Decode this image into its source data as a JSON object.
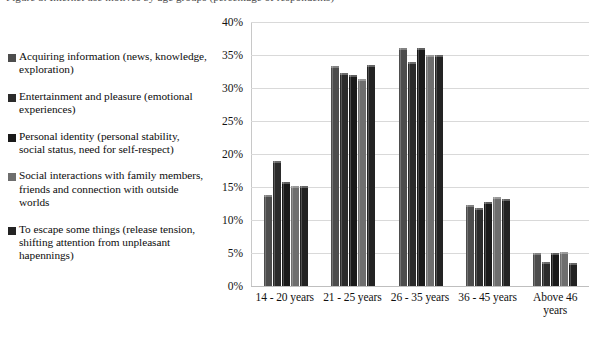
{
  "caption": {
    "text": "Figure 5. Internet use motives by age groups (percentage of respondents)"
  },
  "chart_data": {
    "type": "bar",
    "title": "",
    "subtitle": "",
    "xlabel": "",
    "ylabel": "",
    "grid": true,
    "legend_position": "left",
    "ylim": [
      0,
      40
    ],
    "ytick_labels": [
      "40%",
      "35%",
      "30%",
      "25%",
      "20%",
      "15%",
      "10%",
      "5%",
      "0%"
    ],
    "ytick_values": [
      40,
      35,
      30,
      25,
      20,
      15,
      10,
      5,
      0
    ],
    "categories": [
      "14 - 20 years",
      "21 - 25 years",
      "26 - 35 years",
      "36 - 45 years",
      "Above 46 years"
    ],
    "series": [
      {
        "name": "Acquiring information (news, knowledge, exploration)",
        "color": "#4d4d4d",
        "values": [
          13.8,
          33.3,
          36.0,
          12.3,
          5.0
        ]
      },
      {
        "name": "Entertainment and pleasure (emotional experiences)",
        "color": "#2b2b2b",
        "values": [
          19.0,
          32.3,
          34.0,
          11.8,
          3.6
        ]
      },
      {
        "name": "Personal identity (personal stability, social status, need for self-respect)",
        "color": "#1a1a1a",
        "values": [
          15.7,
          32.0,
          36.0,
          12.8,
          5.0
        ]
      },
      {
        "name": "Social interactions with family members, friends and connection with outside worlds",
        "color": "#6e6e6e",
        "values": [
          15.2,
          31.3,
          35.0,
          13.5,
          5.1
        ]
      },
      {
        "name": "To escape some things (release tension, shifting attention from unpleasant hapennings)",
        "color": "#232323",
        "values": [
          15.2,
          33.5,
          35.0,
          13.2,
          3.5
        ]
      }
    ]
  }
}
